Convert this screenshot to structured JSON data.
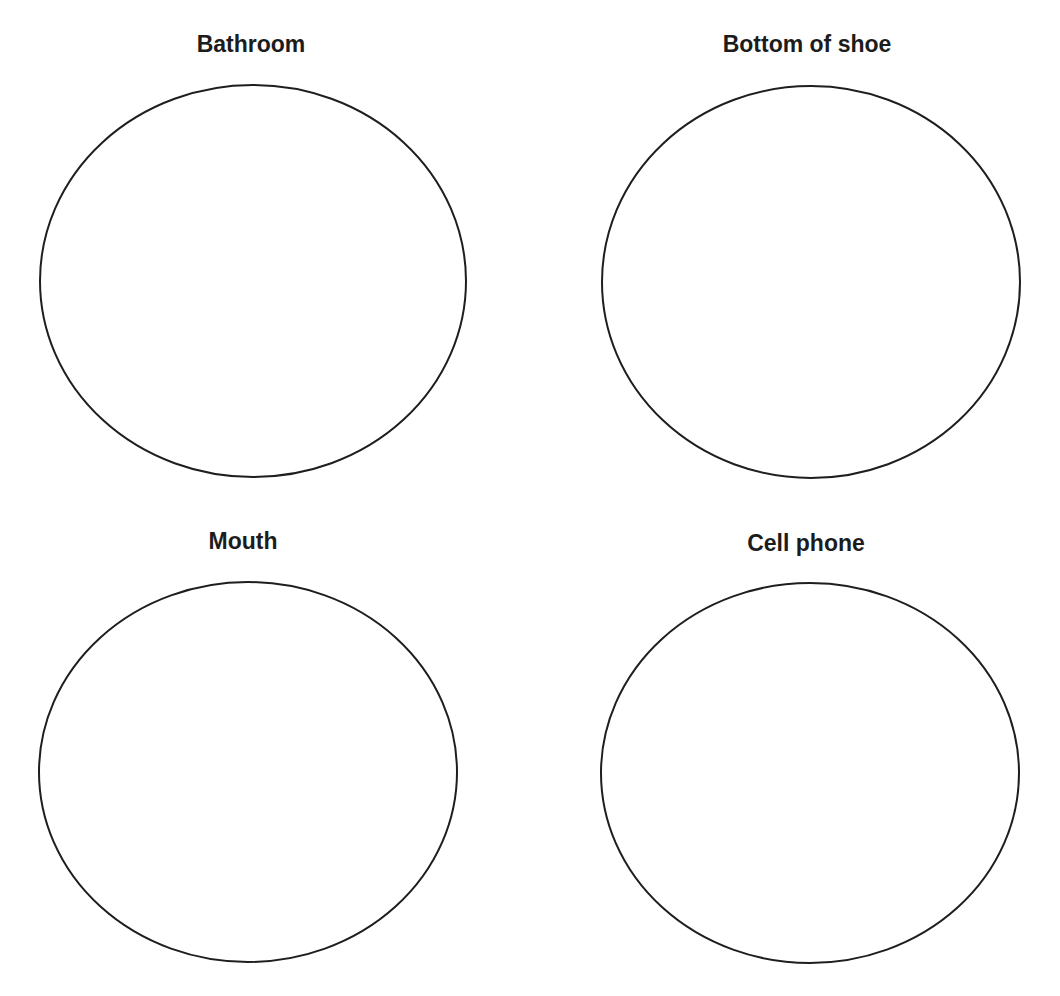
{
  "worksheet": {
    "panels": [
      {
        "label": "Bathroom",
        "label_x": 251,
        "label_y": 30,
        "cx": 253,
        "cy": 281,
        "rx": 213,
        "ry": 196
      },
      {
        "label": "Bottom of shoe",
        "label_x": 807,
        "label_y": 30,
        "cx": 811,
        "cy": 282,
        "rx": 209,
        "ry": 196
      },
      {
        "label": "Mouth",
        "label_x": 243,
        "label_y": 527,
        "cx": 248,
        "cy": 772,
        "rx": 209,
        "ry": 190
      },
      {
        "label": "Cell phone",
        "label_x": 806,
        "label_y": 529,
        "cx": 810,
        "cy": 773,
        "rx": 209,
        "ry": 190
      }
    ],
    "stroke_color": "#1e1e1e",
    "background_color": "#ffffff"
  }
}
